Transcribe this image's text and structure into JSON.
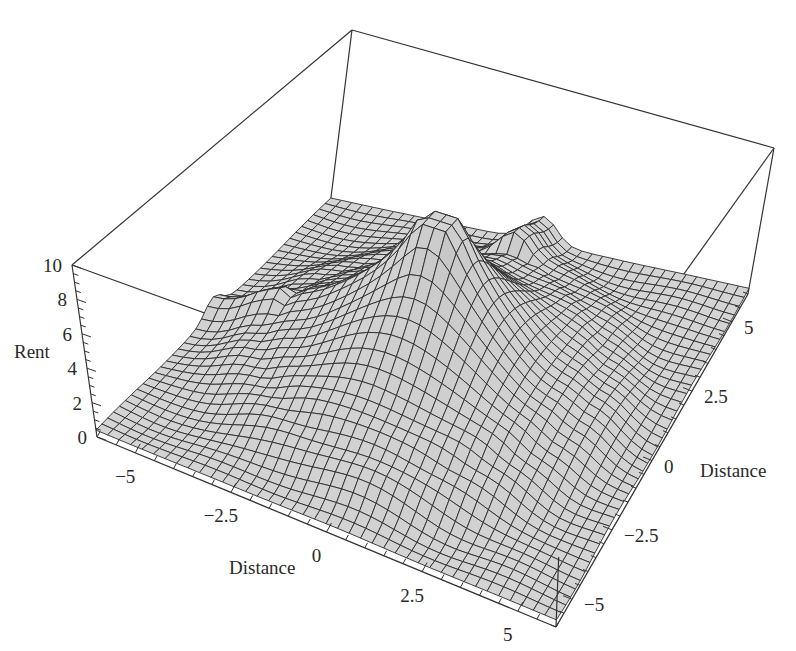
{
  "header": {
    "cut_off_title_fragment": "...py..."
  },
  "chart_data": {
    "type": "surface3d",
    "title": "",
    "xlabel": "Distance",
    "ylabel": "Distance",
    "zlabel": "Rent",
    "x_range": [
      -6,
      6
    ],
    "y_range": [
      -6,
      6
    ],
    "z_range": [
      0,
      10
    ],
    "x_ticks": [
      -5,
      -2.5,
      0,
      2.5,
      5
    ],
    "y_ticks": [
      -5,
      -2.5,
      0,
      2.5,
      5
    ],
    "z_ticks": [
      0,
      2,
      4,
      6,
      8,
      10
    ],
    "x_tick_labels": [
      "−5",
      "−2.5",
      "0",
      "2.5",
      "5"
    ],
    "y_tick_labels": [
      "−5",
      "−2.5",
      "0",
      "2.5",
      "5"
    ],
    "z_tick_labels": [
      "0",
      "2",
      "4",
      "6",
      "8",
      "10"
    ],
    "surface_description": "Bid-rent surface: sharp central peak (~10) at origin, a raised circular plateau/ring (~6-7) of radius ~4, a ridge spike along negative x axis back edge, flattening to ~0-1 at the outer edges.",
    "features": [
      {
        "name": "central peak",
        "x": 0,
        "y": 0,
        "z": 10
      },
      {
        "name": "ring plateau",
        "radius": 4,
        "z": 6.5
      },
      {
        "name": "outer floor",
        "z": 0.5
      }
    ],
    "grid_resolution": 40,
    "mesh_color": "#2b2b2b",
    "fill_color": "#d4d4d4",
    "box_color": "#333333"
  }
}
